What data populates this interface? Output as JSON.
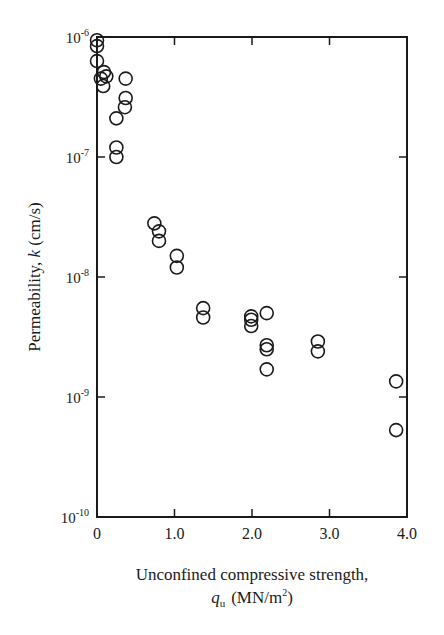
{
  "chart_data": {
    "type": "scatter",
    "title": "",
    "xlabel": "Unconfined compressive strength,",
    "xlabel_line2_symbol": "q",
    "xlabel_line2_subscript": "u",
    "xlabel_line2_units": "(MN/m",
    "xlabel_line2_units_sup": "2",
    "xlabel_line2_close": ")",
    "ylabel_prefix": "Permeability, ",
    "ylabel_symbol": "k",
    "ylabel_suffix": " (cm/s)",
    "xlim": [
      0,
      4.0
    ],
    "ylim": [
      1e-10,
      1e-06
    ],
    "yscale": "log",
    "grid": false,
    "legend": null,
    "marker": "open-circle",
    "x_ticks": [
      {
        "value": 0,
        "label": "0"
      },
      {
        "value": 1.0,
        "label": "1.0"
      },
      {
        "value": 2.0,
        "label": "2.0"
      },
      {
        "value": 3.0,
        "label": "3.0"
      },
      {
        "value": 4.0,
        "label": "4.0"
      }
    ],
    "y_ticks": [
      {
        "exp": -6,
        "base": "10",
        "sup": "-6"
      },
      {
        "exp": -7,
        "base": "10",
        "sup": "-7"
      },
      {
        "exp": -8,
        "base": "10",
        "sup": "-8"
      },
      {
        "exp": -9,
        "base": "10",
        "sup": "-9"
      },
      {
        "exp": -10,
        "base": "10",
        "sup": "-10"
      }
    ],
    "series": [
      {
        "name": "data",
        "points": [
          {
            "x": 0.0,
            "y": 9.4e-07
          },
          {
            "x": 0.0,
            "y": 8.4e-07
          },
          {
            "x": 0.0,
            "y": 6.3e-07
          },
          {
            "x": 0.09,
            "y": 5.1e-07
          },
          {
            "x": 0.12,
            "y": 4.7e-07
          },
          {
            "x": 0.05,
            "y": 4.5e-07
          },
          {
            "x": 0.08,
            "y": 3.9e-07
          },
          {
            "x": 0.37,
            "y": 4.5e-07
          },
          {
            "x": 0.37,
            "y": 3.1e-07
          },
          {
            "x": 0.36,
            "y": 2.6e-07
          },
          {
            "x": 0.25,
            "y": 2.1e-07
          },
          {
            "x": 0.25,
            "y": 1.2e-07
          },
          {
            "x": 0.25,
            "y": 1e-07
          },
          {
            "x": 0.74,
            "y": 2.8e-08
          },
          {
            "x": 0.8,
            "y": 2.4e-08
          },
          {
            "x": 0.8,
            "y": 2e-08
          },
          {
            "x": 1.03,
            "y": 1.5e-08
          },
          {
            "x": 1.03,
            "y": 1.2e-08
          },
          {
            "x": 1.37,
            "y": 5.5e-09
          },
          {
            "x": 1.37,
            "y": 4.6e-09
          },
          {
            "x": 1.99,
            "y": 4.7e-09
          },
          {
            "x": 1.99,
            "y": 4.4e-09
          },
          {
            "x": 1.99,
            "y": 3.9e-09
          },
          {
            "x": 2.19,
            "y": 5e-09
          },
          {
            "x": 2.19,
            "y": 2.7e-09
          },
          {
            "x": 2.19,
            "y": 2.5e-09
          },
          {
            "x": 2.19,
            "y": 1.7e-09
          },
          {
            "x": 2.85,
            "y": 2.9e-09
          },
          {
            "x": 2.85,
            "y": 2.4e-09
          },
          {
            "x": 3.86,
            "y": 1.35e-09
          },
          {
            "x": 3.86,
            "y": 5.3e-10
          }
        ]
      }
    ]
  },
  "colors": {
    "ink": "#1a1a1a",
    "background": "#ffffff"
  }
}
